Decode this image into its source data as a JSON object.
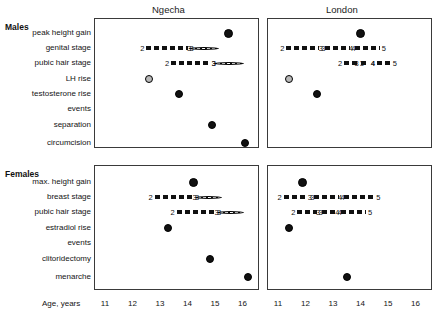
{
  "figure": {
    "axis_label": "Age, years",
    "x_ticks": [
      11,
      12,
      13,
      14,
      15,
      16
    ],
    "xlim": [
      10.6,
      16.6
    ],
    "panels": [
      {
        "title": "Ngecha"
      },
      {
        "title": "London"
      }
    ],
    "groups": [
      {
        "label": "Males"
      },
      {
        "label": "Females"
      }
    ]
  },
  "male_rows": [
    {
      "label": "peak height gain"
    },
    {
      "label": "genital stage"
    },
    {
      "label": "pubic hair stage"
    },
    {
      "label": "LH rise"
    },
    {
      "label": "testosterone rise"
    },
    {
      "label": "events"
    },
    {
      "label": "separation"
    },
    {
      "label": "circumcision"
    }
  ],
  "female_rows": [
    {
      "label": "max. height gain"
    },
    {
      "label": "breast stage"
    },
    {
      "label": "pubic hair stage"
    },
    {
      "label": "estradiol rise"
    },
    {
      "label": "events"
    },
    {
      "label": "clitoridectomy"
    },
    {
      "label": "menarche"
    }
  ],
  "chart_data": {
    "type": "scatter",
    "xlabel": "Age, years",
    "ylabel": "",
    "xlim": [
      10.6,
      16.6
    ],
    "xticks": [
      11,
      12,
      13,
      14,
      15,
      16
    ],
    "grid": false,
    "legend": "none",
    "marker_types": {
      "filled": "filled black circle",
      "open": "grey filled circle"
    },
    "panels": [
      {
        "group": "Males",
        "site": "Ngecha",
        "points": [
          {
            "row": "peak height gain",
            "age": 15.5,
            "marker": "filled"
          },
          {
            "row": "LH rise",
            "age": 12.6,
            "marker": "open"
          },
          {
            "row": "testosterone rise",
            "age": 13.7,
            "marker": "filled"
          },
          {
            "row": "separation",
            "age": 14.9,
            "marker": "filled"
          },
          {
            "row": "circumcision",
            "age": 16.1,
            "marker": "filled"
          }
        ],
        "stage_bars": [
          {
            "row": "genital stage",
            "segments": [
              {
                "from_label": "2",
                "to_label": "3",
                "from_age": 12.5,
                "to_age": 14.0,
                "style": "dash"
              },
              {
                "from_label": "3",
                "to_label": "",
                "from_age": 14.2,
                "to_age": 15.3,
                "style": "dot"
              }
            ]
          },
          {
            "row": "pubic hair stage",
            "segments": [
              {
                "from_label": "2",
                "to_label": "3",
                "from_age": 13.4,
                "to_age": 14.8,
                "style": "dash"
              },
              {
                "from_label": "3",
                "to_label": "",
                "from_age": 15.1,
                "to_age": 16.2,
                "style": "dot"
              }
            ]
          }
        ]
      },
      {
        "group": "Males",
        "site": "London",
        "points": [
          {
            "row": "peak height gain",
            "age": 14.0,
            "marker": "filled"
          },
          {
            "row": "LH rise",
            "age": 11.4,
            "marker": "open"
          },
          {
            "row": "testosterone rise",
            "age": 12.4,
            "marker": "filled"
          }
        ],
        "stage_bars": [
          {
            "row": "genital stage",
            "segments": [
              {
                "from_label": "2",
                "to_label": "3",
                "from_age": 11.3,
                "to_age": 12.5,
                "style": "dash"
              },
              {
                "from_label": "3",
                "to_label": "4",
                "from_age": 12.7,
                "to_age": 13.6,
                "style": "dash"
              },
              {
                "from_label": "4",
                "to_label": "5",
                "from_age": 13.8,
                "to_age": 14.7,
                "style": "dash"
              }
            ]
          },
          {
            "row": "pubic hair stage",
            "segments": [
              {
                "from_label": "2",
                "to_label": "3",
                "from_age": 13.4,
                "to_age": 13.9,
                "style": "dash"
              },
              {
                "from_label": "3",
                "to_label": "4",
                "from_age": 14.0,
                "to_age": 14.3,
                "style": "dash"
              },
              {
                "from_label": "4",
                "to_label": "5",
                "from_age": 14.6,
                "to_age": 15.1,
                "style": "dash"
              }
            ]
          }
        ]
      },
      {
        "group": "Females",
        "site": "Ngecha",
        "points": [
          {
            "row": "max. height gain",
            "age": 14.2,
            "marker": "filled"
          },
          {
            "row": "estradiol rise",
            "age": 13.3,
            "marker": "filled"
          },
          {
            "row": "clitoridectomy",
            "age": 14.8,
            "marker": "filled"
          },
          {
            "row": "menarche",
            "age": 16.2,
            "marker": "filled"
          }
        ],
        "stage_bars": [
          {
            "row": "breast stage",
            "segments": [
              {
                "from_label": "2",
                "to_label": "3",
                "from_age": 12.8,
                "to_age": 14.2,
                "style": "dash"
              },
              {
                "from_label": "3",
                "to_label": "",
                "from_age": 14.4,
                "to_age": 15.4,
                "style": "dot"
              }
            ]
          },
          {
            "row": "pubic hair stage",
            "segments": [
              {
                "from_label": "2",
                "to_label": "3",
                "from_age": 13.6,
                "to_age": 15.0,
                "style": "dash"
              },
              {
                "from_label": "3",
                "to_label": "",
                "from_age": 15.2,
                "to_age": 16.2,
                "style": "dot"
              }
            ]
          }
        ]
      },
      {
        "group": "Females",
        "site": "London",
        "points": [
          {
            "row": "max. height gain",
            "age": 11.9,
            "marker": "filled"
          },
          {
            "row": "estradiol rise",
            "age": 11.4,
            "marker": "filled"
          },
          {
            "row": "menarche",
            "age": 13.5,
            "marker": "filled"
          }
        ],
        "stage_bars": [
          {
            "row": "breast stage",
            "segments": [
              {
                "from_label": "2",
                "to_label": "3",
                "from_age": 11.2,
                "to_age": 12.1,
                "style": "dash"
              },
              {
                "from_label": "3",
                "to_label": "4",
                "from_age": 12.3,
                "to_age": 13.2,
                "style": "dash"
              },
              {
                "from_label": "4",
                "to_label": "5",
                "from_age": 13.4,
                "to_age": 14.5,
                "style": "dash"
              }
            ]
          },
          {
            "row": "pubic hair stage",
            "segments": [
              {
                "from_label": "2",
                "to_label": "3",
                "from_age": 11.7,
                "to_age": 12.4,
                "style": "dash"
              },
              {
                "from_label": "3",
                "to_label": "4",
                "from_age": 12.6,
                "to_age": 13.1,
                "style": "dash"
              },
              {
                "from_label": "4",
                "to_label": "5",
                "from_age": 13.3,
                "to_age": 14.2,
                "style": "dash"
              }
            ]
          }
        ]
      }
    ]
  }
}
